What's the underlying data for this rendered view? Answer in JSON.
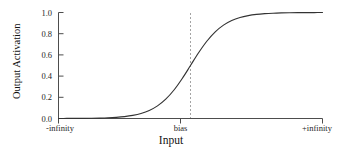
{
  "chart_data": {
    "type": "line",
    "title": "",
    "xlabel": "Input",
    "ylabel": "Output Activation",
    "grid": false,
    "legend": null,
    "xlim": [
      -8,
      8
    ],
    "ylim": [
      0.0,
      1.0
    ],
    "x_tick_labels": [
      "-infinity",
      "bias",
      "+infinity"
    ],
    "x_tick_positions": [
      -8,
      0,
      8
    ],
    "y_tick_labels": [
      "0.0",
      "0.2",
      "0.4",
      "0.6",
      "0.8",
      "1.0"
    ],
    "y_tick_values": [
      0.0,
      0.2,
      0.4,
      0.6,
      0.8,
      1.0
    ],
    "series": [
      {
        "name": "sigmoid",
        "color": "#333333",
        "x": [
          -8.0,
          -7.5,
          -7.0,
          -6.5,
          -6.0,
          -5.5,
          -5.0,
          -4.5,
          -4.0,
          -3.5,
          -3.0,
          -2.5,
          -2.0,
          -1.5,
          -1.0,
          -0.5,
          0.0,
          0.5,
          1.0,
          1.5,
          2.0,
          2.5,
          3.0,
          3.5,
          4.0,
          4.5,
          5.0,
          5.5,
          6.0,
          6.5,
          7.0,
          7.5,
          8.0
        ],
        "values": [
          0.0003,
          0.0006,
          0.0009,
          0.0015,
          0.0025,
          0.0041,
          0.0067,
          0.011,
          0.018,
          0.0293,
          0.0474,
          0.0759,
          0.1192,
          0.1824,
          0.2689,
          0.3775,
          0.5,
          0.6225,
          0.7311,
          0.8176,
          0.8808,
          0.9241,
          0.9526,
          0.9707,
          0.982,
          0.989,
          0.9933,
          0.9959,
          0.9975,
          0.9985,
          0.9991,
          0.9994,
          0.9997
        ]
      }
    ],
    "annotations": [
      {
        "name": "bias-marker",
        "type": "vline",
        "x": 0,
        "label": "bias",
        "style": "dashed",
        "color": "#9a9a9a"
      }
    ],
    "axis_color": "#4d4d4d",
    "curve_color": "#333333"
  }
}
